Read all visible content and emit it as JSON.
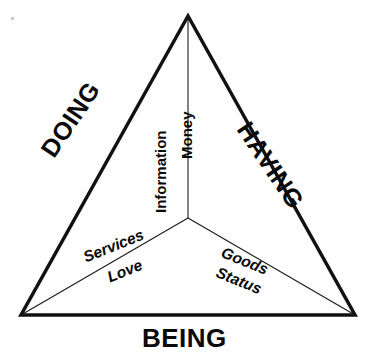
{
  "diagram": {
    "type": "triangle-venn",
    "background_color": "#fefefe",
    "stroke_color": "#111111",
    "outer_stroke_width": 3.5,
    "inner_stroke_width": 1.1,
    "vertices": {
      "apex": [
        188,
        16
      ],
      "bottom_left": [
        21,
        315
      ],
      "bottom_right": [
        355,
        315
      ],
      "center": [
        188,
        218
      ]
    },
    "corner_labels": {
      "left": "DOING",
      "right": "HAVING",
      "bottom": "BEING"
    },
    "spoke_labels": {
      "vertical_left": "Information",
      "vertical_right": "Money",
      "lower_left_above": "Services",
      "lower_left_below": "Love",
      "lower_right_above": "Goods",
      "lower_right_below": "Status"
    }
  }
}
